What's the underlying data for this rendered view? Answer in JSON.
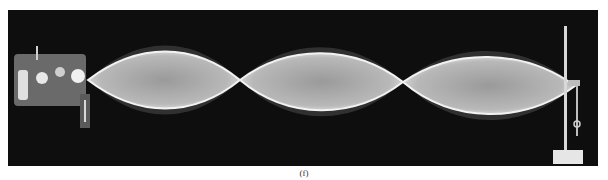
{
  "figure": {
    "caption": "(f)",
    "loops": 3,
    "colors": {
      "background": "#0e0e0e",
      "wave": "#e6e6e6",
      "glow": "#4a4a4a"
    }
  }
}
